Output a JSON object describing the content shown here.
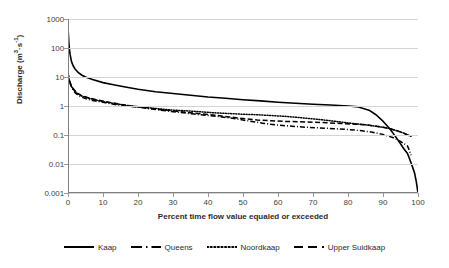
{
  "chart_data": {
    "type": "line",
    "title": "",
    "xlabel": "Percent time flow value equaled or exceeded",
    "ylabel": "Discharge (m3·s-1)",
    "ylabel_html": "Discharge (m<sup>3</sup>·s<sup>-1</sup>)",
    "yscale": "log",
    "ylim": [
      0.001,
      1000
    ],
    "xlim": [
      0,
      100
    ],
    "grid": "horizontal",
    "legend_position": "bottom",
    "y_ticks": [
      "1000",
      "100",
      "10",
      "1",
      "0.1",
      "0.01",
      "0.001"
    ],
    "y_tick_values": [
      1000,
      100,
      10,
      1,
      0.1,
      0.01,
      0.001
    ],
    "x_ticks": [
      "0",
      "10",
      "20",
      "30",
      "40",
      "50",
      "60",
      "70",
      "80",
      "90",
      "100"
    ],
    "x_tick_values": [
      0,
      10,
      20,
      30,
      40,
      50,
      60,
      70,
      80,
      90,
      100
    ],
    "series": [
      {
        "name": "Kaap",
        "style": "solid",
        "color": "#000000",
        "x": [
          0,
          0.3,
          0.6,
          1,
          1.5,
          2,
          3,
          4,
          5,
          7,
          10,
          13,
          16,
          20,
          25,
          30,
          35,
          40,
          45,
          50,
          55,
          60,
          65,
          70,
          75,
          80,
          83,
          86,
          88,
          90,
          92,
          94,
          95,
          96,
          97,
          97.5,
          98,
          98.5,
          99,
          99.5,
          100
        ],
        "y": [
          500,
          120,
          60,
          34,
          24,
          19,
          14,
          11.5,
          10,
          8.2,
          6.4,
          5.4,
          4.6,
          3.8,
          3.1,
          2.7,
          2.35,
          2.05,
          1.85,
          1.65,
          1.5,
          1.35,
          1.25,
          1.15,
          1.08,
          1.0,
          0.93,
          0.72,
          0.5,
          0.3,
          0.16,
          0.075,
          0.05,
          0.033,
          0.023,
          0.016,
          0.011,
          0.0075,
          0.005,
          0.0025,
          0.001
        ]
      },
      {
        "name": "Queens",
        "style": "dash-dot",
        "color": "#000000",
        "x": [
          0,
          0.3,
          0.7,
          1.2,
          2,
          3,
          4,
          5,
          7,
          10,
          13,
          16,
          20,
          24,
          28,
          32,
          36,
          40,
          44,
          48,
          52,
          56,
          60,
          64,
          68,
          72,
          76,
          80,
          84,
          87,
          90,
          93,
          95,
          96,
          97,
          97.5,
          98
        ],
        "y": [
          14,
          8.5,
          5.5,
          4.0,
          2.9,
          2.3,
          2.0,
          1.8,
          1.55,
          1.35,
          1.15,
          1.02,
          0.92,
          0.78,
          0.68,
          0.6,
          0.53,
          0.47,
          0.42,
          0.36,
          0.3,
          0.25,
          0.22,
          0.2,
          0.185,
          0.175,
          0.165,
          0.155,
          0.14,
          0.125,
          0.105,
          0.08,
          0.06,
          0.05,
          0.042,
          0.03,
          0.02
        ]
      },
      {
        "name": "Noordkaap",
        "style": "dotted",
        "color": "#000000",
        "x": [
          0,
          0.4,
          0.9,
          1.5,
          2.5,
          4,
          6,
          8,
          11,
          14,
          18,
          22,
          26,
          30,
          34,
          38,
          42,
          46,
          50,
          54,
          58,
          62,
          66,
          70,
          74,
          78,
          82,
          85,
          88,
          90,
          92,
          94,
          96,
          97,
          97.5,
          98
        ],
        "y": [
          12,
          7.5,
          5.0,
          3.8,
          2.8,
          2.2,
          1.85,
          1.6,
          1.35,
          1.18,
          1.0,
          0.9,
          0.8,
          0.72,
          0.68,
          0.63,
          0.58,
          0.55,
          0.52,
          0.5,
          0.47,
          0.44,
          0.4,
          0.36,
          0.32,
          0.28,
          0.245,
          0.225,
          0.2,
          0.185,
          0.165,
          0.14,
          0.115,
          0.1,
          0.095,
          0.09
        ]
      },
      {
        "name": "Upper Suidkaap",
        "style": "dashed",
        "color": "#000000",
        "x": [
          0,
          0.4,
          0.9,
          1.5,
          2.5,
          4,
          6,
          8,
          11,
          14,
          18,
          22,
          26,
          30,
          34,
          38,
          42,
          46,
          50,
          54,
          58,
          62,
          66,
          70,
          74,
          78,
          82,
          85,
          88,
          90,
          92,
          94,
          96,
          97,
          97.5,
          98
        ],
        "y": [
          13,
          8.0,
          5.2,
          3.9,
          2.85,
          2.25,
          1.9,
          1.65,
          1.4,
          1.2,
          1.0,
          0.88,
          0.76,
          0.68,
          0.6,
          0.54,
          0.48,
          0.42,
          0.37,
          0.33,
          0.31,
          0.295,
          0.285,
          0.275,
          0.265,
          0.25,
          0.235,
          0.225,
          0.2,
          0.185,
          0.165,
          0.14,
          0.115,
          0.1,
          0.095,
          0.09
        ]
      }
    ]
  },
  "legend": {
    "items": [
      {
        "label": "Kaap",
        "style": "solid"
      },
      {
        "label": "Queens",
        "style": "dash-dot"
      },
      {
        "label": "Noordkaap",
        "style": "dotted"
      },
      {
        "label": "Upper Suidkaap",
        "style": "dashed"
      }
    ]
  },
  "axes": {
    "x_title": "Percent time flow value equaled or exceeded",
    "y_title_base": "Discharge (m",
    "y_title_sup1": "3",
    "y_title_mid": "·s",
    "y_title_sup2": "-1",
    "y_title_end": ")"
  }
}
